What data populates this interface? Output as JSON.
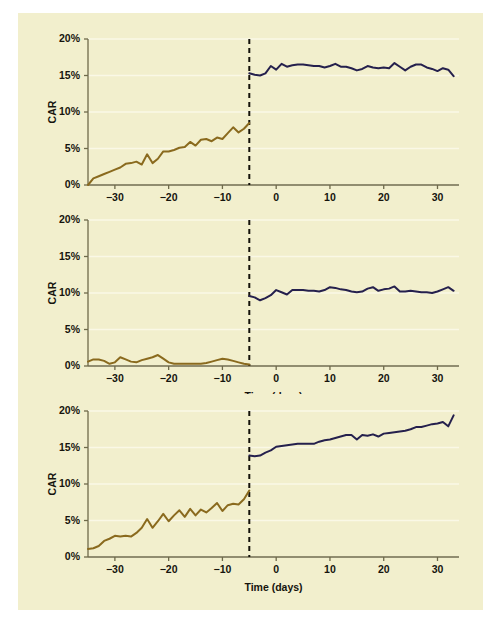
{
  "figure": {
    "background_color": "#f2efcd",
    "outer_color": "#ffffff",
    "pre_color": "#8a6a1e",
    "post_color": "#25204d",
    "grid_color": "#faf8e6",
    "axis_color": "#6f6a4b",
    "event_line_color": "#14120a"
  },
  "chart_data": [
    {
      "type": "line",
      "title": "",
      "xlabel": "Time (days)",
      "ylabel": "CAR",
      "xlim": [
        -35,
        34
      ],
      "ylim": [
        0,
        20
      ],
      "xticks": [
        -30,
        -20,
        -10,
        0,
        10,
        20,
        30
      ],
      "xtick_labels": [
        "−30",
        "−20",
        "−10",
        "0",
        "10",
        "20",
        "30"
      ],
      "yticks": [
        0,
        5,
        10,
        15,
        20
      ],
      "ytick_labels": [
        "0%",
        "5%",
        "10%",
        "15%",
        "20%"
      ],
      "grid": true,
      "legend": "none",
      "annotations": [
        {
          "type": "vline",
          "x": -5,
          "style": "dashed",
          "label": "event day"
        }
      ],
      "series": [
        {
          "name": "pre-event CAR",
          "color": "#8a6a1e",
          "x": [
            -35,
            -34,
            -33,
            -32,
            -31,
            -30,
            -29,
            -28,
            -27,
            -26,
            -25,
            -24,
            -23,
            -22,
            -21,
            -20,
            -19,
            -18,
            -17,
            -16,
            -15,
            -14,
            -13,
            -12,
            -11,
            -10,
            -9,
            -8,
            -7,
            -6,
            -5
          ],
          "values": [
            0.0,
            0.9,
            1.2,
            1.5,
            1.8,
            2.1,
            2.4,
            2.9,
            3.0,
            3.2,
            2.8,
            4.2,
            3.0,
            3.6,
            4.6,
            4.6,
            4.8,
            5.1,
            5.2,
            5.9,
            5.4,
            6.2,
            6.3,
            6.0,
            6.5,
            6.3,
            7.1,
            7.9,
            7.2,
            7.7,
            8.5
          ]
        },
        {
          "name": "post-event CAR",
          "color": "#25204d",
          "x": [
            -5,
            -4,
            -3,
            -2,
            -1,
            0,
            1,
            2,
            3,
            4,
            5,
            6,
            7,
            8,
            9,
            10,
            11,
            12,
            13,
            14,
            15,
            16,
            17,
            18,
            19,
            20,
            21,
            22,
            23,
            24,
            25,
            26,
            27,
            28,
            29,
            30,
            31,
            32,
            33
          ],
          "values": [
            15.3,
            15.1,
            15.0,
            15.3,
            16.3,
            15.8,
            16.6,
            16.2,
            16.4,
            16.5,
            16.5,
            16.4,
            16.3,
            16.3,
            16.1,
            16.3,
            16.6,
            16.2,
            16.2,
            16.0,
            15.7,
            15.9,
            16.3,
            16.1,
            16.0,
            16.1,
            16.0,
            16.7,
            16.2,
            15.7,
            16.2,
            16.5,
            16.5,
            16.1,
            15.9,
            15.6,
            16.0,
            15.8,
            14.9
          ]
        }
      ]
    },
    {
      "type": "line",
      "title": "",
      "xlabel": "Time (days)",
      "ylabel": "CAR",
      "xlim": [
        -35,
        34
      ],
      "ylim": [
        0,
        20
      ],
      "xticks": [
        -30,
        -20,
        -10,
        0,
        10,
        20,
        30
      ],
      "xtick_labels": [
        "−30",
        "−20",
        "−10",
        "0",
        "10",
        "20",
        "30"
      ],
      "yticks": [
        0,
        5,
        10,
        15,
        20
      ],
      "ytick_labels": [
        "0%",
        "5%",
        "10%",
        "15%",
        "20%"
      ],
      "grid": true,
      "legend": "none",
      "annotations": [
        {
          "type": "vline",
          "x": -5,
          "style": "dashed",
          "label": "event day"
        }
      ],
      "series": [
        {
          "name": "pre-event CAR",
          "color": "#8a6a1e",
          "x": [
            -35,
            -34,
            -33,
            -32,
            -31,
            -30,
            -29,
            -28,
            -27,
            -26,
            -25,
            -24,
            -23,
            -22,
            -21,
            -20,
            -19,
            -18,
            -17,
            -16,
            -15,
            -14,
            -13,
            -12,
            -11,
            -10,
            -9,
            -8,
            -7,
            -6,
            -5
          ],
          "values": [
            0.6,
            0.9,
            0.9,
            0.7,
            0.3,
            0.5,
            1.2,
            0.9,
            0.6,
            0.5,
            0.8,
            1.0,
            1.2,
            1.5,
            1.0,
            0.5,
            0.3,
            0.3,
            0.3,
            0.3,
            0.3,
            0.3,
            0.4,
            0.6,
            0.8,
            1.0,
            0.9,
            0.7,
            0.5,
            0.3,
            0.2
          ]
        },
        {
          "name": "post-event CAR",
          "color": "#25204d",
          "x": [
            -5,
            -4,
            -3,
            -2,
            -1,
            0,
            1,
            2,
            3,
            4,
            5,
            6,
            7,
            8,
            9,
            10,
            11,
            12,
            13,
            14,
            15,
            16,
            17,
            18,
            19,
            20,
            21,
            22,
            23,
            24,
            25,
            26,
            27,
            28,
            29,
            30,
            31,
            32,
            33
          ],
          "values": [
            9.6,
            9.4,
            9.0,
            9.3,
            9.7,
            10.4,
            10.1,
            9.8,
            10.4,
            10.4,
            10.4,
            10.3,
            10.3,
            10.2,
            10.4,
            10.8,
            10.7,
            10.5,
            10.4,
            10.2,
            10.1,
            10.2,
            10.6,
            10.8,
            10.3,
            10.5,
            10.6,
            10.9,
            10.2,
            10.2,
            10.3,
            10.2,
            10.1,
            10.1,
            10.0,
            10.2,
            10.5,
            10.8,
            10.3
          ]
        }
      ]
    },
    {
      "type": "line",
      "title": "",
      "xlabel": "Time (days)",
      "ylabel": "CAR",
      "xlim": [
        -35,
        34
      ],
      "ylim": [
        0,
        20
      ],
      "xticks": [
        -30,
        -20,
        -10,
        0,
        10,
        20,
        30
      ],
      "xtick_labels": [
        "−30",
        "−20",
        "−10",
        "0",
        "10",
        "20",
        "30"
      ],
      "yticks": [
        0,
        5,
        10,
        15,
        20
      ],
      "ytick_labels": [
        "0%",
        "5%",
        "10%",
        "15%",
        "20%"
      ],
      "grid": true,
      "legend": "none",
      "annotations": [
        {
          "type": "vline",
          "x": -5,
          "style": "dashed",
          "label": "event day"
        }
      ],
      "series": [
        {
          "name": "pre-event CAR",
          "color": "#8a6a1e",
          "x": [
            -35,
            -34,
            -33,
            -32,
            -31,
            -30,
            -29,
            -28,
            -27,
            -26,
            -25,
            -24,
            -23,
            -22,
            -21,
            -20,
            -19,
            -18,
            -17,
            -16,
            -15,
            -14,
            -13,
            -12,
            -11,
            -10,
            -9,
            -8,
            -7,
            -6,
            -5
          ],
          "values": [
            1.1,
            1.2,
            1.5,
            2.2,
            2.5,
            2.9,
            2.8,
            2.9,
            2.8,
            3.3,
            4.0,
            5.2,
            4.0,
            4.9,
            5.9,
            4.9,
            5.7,
            6.4,
            5.5,
            6.6,
            5.7,
            6.5,
            6.1,
            6.7,
            7.4,
            6.3,
            7.1,
            7.3,
            7.2,
            7.9,
            9.1
          ]
        },
        {
          "name": "post-event CAR",
          "color": "#25204d",
          "x": [
            -5,
            -4,
            -3,
            -2,
            -1,
            0,
            1,
            2,
            3,
            4,
            5,
            6,
            7,
            8,
            9,
            10,
            11,
            12,
            13,
            14,
            15,
            16,
            17,
            18,
            19,
            20,
            21,
            22,
            23,
            24,
            25,
            26,
            27,
            28,
            29,
            30,
            31,
            32,
            33
          ],
          "values": [
            13.9,
            13.8,
            13.9,
            14.3,
            14.6,
            15.1,
            15.2,
            15.3,
            15.4,
            15.5,
            15.5,
            15.5,
            15.5,
            15.8,
            16.0,
            16.1,
            16.3,
            16.5,
            16.7,
            16.7,
            16.1,
            16.7,
            16.6,
            16.8,
            16.5,
            16.9,
            17.0,
            17.1,
            17.2,
            17.3,
            17.5,
            17.8,
            17.8,
            18.0,
            18.2,
            18.3,
            18.5,
            17.9,
            19.4
          ]
        }
      ]
    }
  ]
}
